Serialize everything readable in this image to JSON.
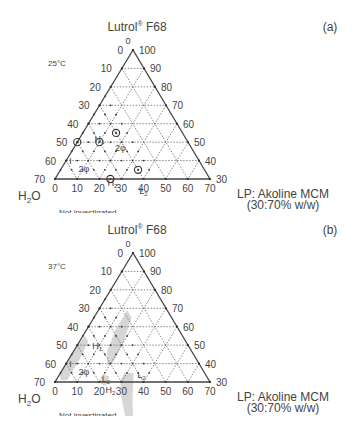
{
  "panels": [
    {
      "id": "a",
      "label": "(a)",
      "temperature": "25°C",
      "top_axis_title": "Lutrol",
      "top_axis_sup": "®",
      "top_axis_suffix": " F68",
      "left_corner_label": "H",
      "left_corner_sub": "2",
      "left_corner_suffix": "O",
      "right_corner_label_1": "LP: Akoline MCM",
      "right_corner_label_2": "(30:70% w/w)",
      "not_investigated": "Not investigated"
    },
    {
      "id": "b",
      "label": "(b)",
      "temperature": "37°C",
      "top_axis_title": "Lutrol",
      "top_axis_sup": "®",
      "top_axis_suffix": " F68",
      "left_corner_label": "H",
      "left_corner_sub": "2",
      "left_corner_suffix": "O",
      "right_corner_label_1": "LP: Akoline MCM",
      "right_corner_label_2": "(30:70% w/w)",
      "not_investigated": "Not investigated"
    }
  ],
  "chart_data": [
    {
      "type": "ternary",
      "title": "(a) 25°C",
      "axes": {
        "top": "Lutrol® F68",
        "left": "H2O",
        "right": "LP: Akoline MCM (30:70% w/w)"
      },
      "left_axis_ticks": [
        0,
        10,
        20,
        30,
        40,
        50,
        60,
        70
      ],
      "right_axis_ticks": [
        30,
        40,
        50,
        60,
        70,
        80,
        90,
        100
      ],
      "bottom_axis_ticks": [
        0,
        10,
        20,
        30,
        40,
        50,
        60,
        70
      ],
      "grid": "dotted",
      "region_labels": [
        {
          "text": "H1",
          "lp": 10,
          "w": 40
        },
        {
          "text": "2φ",
          "lp": 22,
          "w": 33
        },
        {
          "text": "H2",
          "lp": 28,
          "w": 46
        },
        {
          "text": "I",
          "lp": 3,
          "w": 59
        },
        {
          "text": "2φ",
          "lp": 11,
          "w": 55
        },
        {
          "text": "L2",
          "lp": 44,
          "w": 34
        }
      ],
      "circled_points": [
        {
          "lp": 15,
          "w": 30
        },
        {
          "lp": 10,
          "w": 40
        },
        {
          "lp": 35,
          "w": 30
        },
        {
          "lp": 0,
          "w": 50
        },
        {
          "lp": 25,
          "w": 45
        }
      ]
    },
    {
      "type": "ternary",
      "title": "(b) 37°C",
      "axes": {
        "top": "Lutrol® F68",
        "left": "H2O",
        "right": "LP: Akoline MCM (30:70% w/w)"
      },
      "left_axis_ticks": [
        0,
        10,
        20,
        30,
        40,
        50,
        60,
        70
      ],
      "right_axis_ticks": [
        30,
        40,
        50,
        60,
        70,
        80,
        90,
        100
      ],
      "bottom_axis_ticks": [
        0,
        10,
        20,
        30,
        40,
        50,
        60,
        70
      ],
      "grid": "dotted",
      "region_labels": [
        {
          "text": "H1",
          "lp": 10,
          "w": 42
        },
        {
          "text": "2φ",
          "lp": 11,
          "w": 55
        },
        {
          "text": "L2",
          "lp": 23,
          "w": 47
        },
        {
          "text": "H2",
          "lp": 28,
          "w": 48
        },
        {
          "text": "I",
          "lp": 3,
          "w": 59
        },
        {
          "text": "L2",
          "lp": 38,
          "w": 30
        }
      ],
      "shaded_regions": [
        "I (left edge, w≈45–65)",
        "upper band (lp≈13–20, w≈20–40)",
        "L2 band (lp≈30–50, w≈30–50)"
      ]
    }
  ]
}
